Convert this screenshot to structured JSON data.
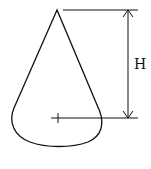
{
  "diagram": {
    "dimension_label": "H",
    "stroke_color": "#111111",
    "background": "#ffffff"
  }
}
